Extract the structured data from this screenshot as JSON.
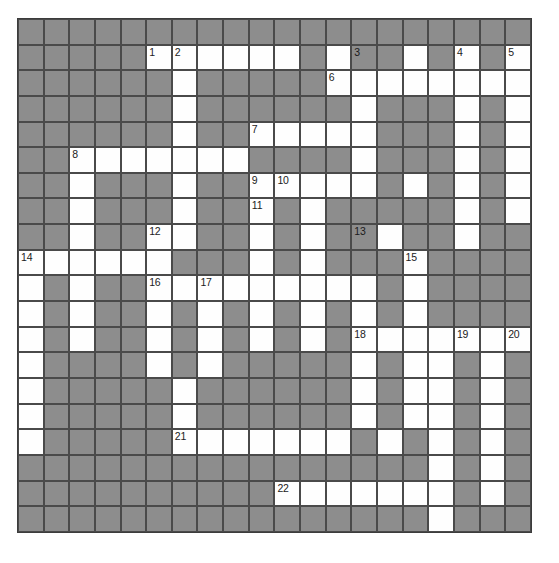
{
  "puzzle": {
    "title": "Crossword Grid",
    "type": "crossword-grid",
    "columns": 20,
    "rows": 20,
    "cell_size_px": 25.65,
    "origin": {
      "x": 17,
      "y": 18
    },
    "colors": {
      "block": "#8d8d8d",
      "open": "#fefefe",
      "grid_line": "#4a4a4a",
      "border": "#3c3c3c",
      "number_text": "#1b1b1b",
      "page_background": "#ffffff"
    },
    "legend": {
      "open_cell": "white writable square",
      "block_cell": "grey blocked square"
    },
    "grid": [
      "BBBBBBBBBBBBBBBBBBBB",
      "BBBBBOOOOOOBOBBOBOBO",
      "BBBBBBOBBBBBOOOOOOOO",
      "BBBBBBOBBBBBBOBBBOBO",
      "BBBBBBOBBOOOOOBBBOBO",
      "BBOOOOOOOBBBBOBBBOBO",
      "BBOBBBOBBOOOOOBOBOBO",
      "BBOBBBOBBOBOBBBBBOBO",
      "BBOBBOOBBOBOBBOBBOBB",
      "OOOOOOBBBOBOBBBOBBBB",
      "OBOBBOOOOOOOOOBOBBBB",
      "OBOBBOBOBOBOBOBOBBBB",
      "OBOBBOBOBOBOBOOOOOOO",
      "OBBBBOBOBBBBBOBOOBOB",
      "OBBBBBOBBBBBBOBOOBOB",
      "OBBBBBOBBBBBBOBOOBOB",
      "OBBBBBOOOOOOOBOBOBOB",
      "BBBBBBBBBBBBBBBBOBOB",
      "BBBBBBBBBBOOOOOOOBOB",
      "BBBBBBBBBBBBBBBBOBBB"
    ],
    "numbers": [
      {
        "n": 1,
        "row": 1,
        "col": 5
      },
      {
        "n": 2,
        "row": 1,
        "col": 6
      },
      {
        "n": 3,
        "row": 1,
        "col": 13
      },
      {
        "n": 4,
        "row": 1,
        "col": 17
      },
      {
        "n": 5,
        "row": 1,
        "col": 19
      },
      {
        "n": 6,
        "row": 2,
        "col": 12
      },
      {
        "n": 7,
        "row": 4,
        "col": 9
      },
      {
        "n": 8,
        "row": 5,
        "col": 2
      },
      {
        "n": 9,
        "row": 6,
        "col": 9
      },
      {
        "n": 10,
        "row": 6,
        "col": 10
      },
      {
        "n": 11,
        "row": 7,
        "col": 9
      },
      {
        "n": 12,
        "row": 8,
        "col": 5
      },
      {
        "n": 13,
        "row": 8,
        "col": 13
      },
      {
        "n": 14,
        "row": 9,
        "col": 0
      },
      {
        "n": 15,
        "row": 9,
        "col": 15
      },
      {
        "n": 16,
        "row": 10,
        "col": 5
      },
      {
        "n": 17,
        "row": 10,
        "col": 7
      },
      {
        "n": 18,
        "row": 12,
        "col": 13
      },
      {
        "n": 19,
        "row": 12,
        "col": 17
      },
      {
        "n": 20,
        "row": 12,
        "col": 19
      },
      {
        "n": 21,
        "row": 16,
        "col": 6
      },
      {
        "n": 22,
        "row": 18,
        "col": 10
      }
    ]
  }
}
